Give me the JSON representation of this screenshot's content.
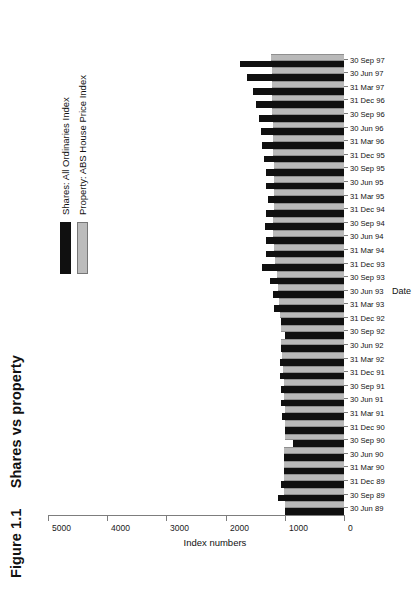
{
  "figure": {
    "number": "Figure 1.1",
    "title": "Shares vs property"
  },
  "chart_data": {
    "type": "bar",
    "title": "Shares vs property",
    "xlabel": "Date",
    "ylabel": "Index numbers",
    "ylim": [
      0,
      5000
    ],
    "yticks": [
      0,
      1000,
      2000,
      3000,
      4000,
      5000
    ],
    "ytick_labels": [
      "0",
      "1000",
      "2000",
      "3000",
      "4000",
      "5000"
    ],
    "grid": false,
    "legend_position": "upper-right",
    "orientation": "vertical-bars-rotated-page",
    "categories": [
      "30 Jun 89",
      "30 Sep 89",
      "31 Dec 89",
      "31 Mar 90",
      "30 Jun 90",
      "30 Sep 90",
      "31 Dec 90",
      "31 Mar 91",
      "30 Jun 91",
      "30 Sep 91",
      "31 Dec 91",
      "31 Mar 92",
      "30 Jun 92",
      "30 Sep 92",
      "31 Dec 92",
      "31 Mar 93",
      "30 Jun 93",
      "30 Sep 93",
      "31 Dec 93",
      "31 Mar 94",
      "30 Jun 94",
      "30 Sep 94",
      "31 Dec 94",
      "31 Mar 95",
      "30 Jun 95",
      "30 Sep 95",
      "31 Dec 95",
      "31 Mar 96",
      "30 Jun 96",
      "30 Sep 96",
      "31 Dec 96",
      "31 Mar 97",
      "30 Jun 97",
      "30 Sep 97"
    ],
    "series": [
      {
        "name": "Shares: All Ordinaries Index",
        "color": "#101010",
        "values": [
          1000,
          1120,
          1060,
          1010,
          1010,
          870,
          1000,
          1040,
          1060,
          1060,
          1080,
          1080,
          1060,
          990,
          1060,
          1180,
          1200,
          1250,
          1380,
          1320,
          1310,
          1330,
          1320,
          1280,
          1320,
          1310,
          1350,
          1380,
          1400,
          1430,
          1480,
          1540,
          1640,
          1760
        ]
      },
      {
        "name": "Property: ABS House Price Index",
        "color": "#bcbcbc",
        "values": [
          1000,
          1010,
          1020,
          1020,
          1010,
          1000,
          1000,
          1000,
          1010,
          1020,
          1030,
          1040,
          1060,
          1070,
          1080,
          1090,
          1110,
          1140,
          1160,
          1180,
          1200,
          1200,
          1190,
          1190,
          1190,
          1190,
          1200,
          1200,
          1200,
          1210,
          1210,
          1210,
          1220,
          1230
        ]
      }
    ]
  },
  "legend": {
    "items": [
      {
        "label": "Shares: All Ordinaries Index",
        "color": "#101010"
      },
      {
        "label": "Property: ABS House Price Index",
        "color": "#bcbcbc"
      }
    ]
  }
}
